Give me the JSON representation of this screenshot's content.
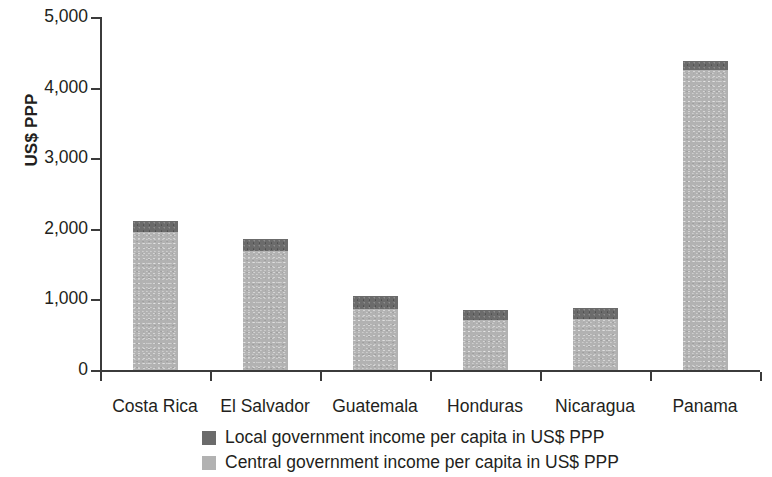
{
  "chart_data": {
    "type": "bar",
    "subtype": "stacked",
    "title": "",
    "xlabel": "",
    "ylabel": "US$ PPP",
    "ylim": [
      0,
      5000
    ],
    "ytick_labels": [
      "0",
      "1,000",
      "2,000",
      "3,000",
      "4,000",
      "5,000"
    ],
    "ytick_values": [
      0,
      1000,
      2000,
      3000,
      4000,
      5000
    ],
    "grid": false,
    "legend_position": "bottom-center",
    "categories": [
      "Costa Rica",
      "El Salvador",
      "Guatemala",
      "Honduras",
      "Nicaragua",
      "Panama"
    ],
    "series": [
      {
        "name": "Central government income per capita in US$ PPP",
        "color": "#b2b2b2",
        "values": [
          1950,
          1680,
          860,
          710,
          720,
          4250
        ]
      },
      {
        "name": "Local government income per capita in US$ PPP",
        "color": "#6b6b6b",
        "values": [
          155,
          170,
          185,
          135,
          160,
          130
        ]
      }
    ],
    "totals": [
      2105,
      1850,
      1045,
      845,
      880,
      4380
    ]
  },
  "legend": {
    "items": [
      {
        "label": "Local government income per capita in US$ PPP",
        "color": "#6b6b6b"
      },
      {
        "label": "Central government income per capita in US$ PPP",
        "color": "#b2b2b2"
      }
    ]
  },
  "axis": {
    "y_title": "US$ PPP"
  }
}
